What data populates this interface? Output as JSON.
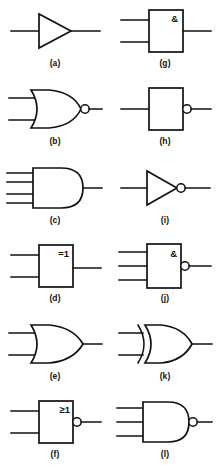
{
  "figure": {
    "background_color": "#ffffff",
    "line_color": "#111111",
    "columns": 2,
    "rows": 6
  },
  "gates": [
    {
      "caption": "(a)",
      "name": "buffer-amplifier",
      "notation": "distinctive-shape",
      "body": "triangle",
      "inputs": 1,
      "output_bubble": false,
      "symbol_label": ""
    },
    {
      "caption": "(b)",
      "name": "nor-gate",
      "notation": "distinctive-shape",
      "body": "or-shape",
      "inputs": 2,
      "output_bubble": true,
      "symbol_label": ""
    },
    {
      "caption": "(c)",
      "name": "and-gate-4-input",
      "notation": "distinctive-shape",
      "body": "and-shape",
      "inputs": 4,
      "output_bubble": false,
      "symbol_label": ""
    },
    {
      "caption": "(d)",
      "name": "xor-gate-iec",
      "notation": "rectangular",
      "body": "rectangle",
      "inputs": 2,
      "output_bubble": false,
      "symbol_label": "=1"
    },
    {
      "caption": "(e)",
      "name": "or-gate",
      "notation": "distinctive-shape",
      "body": "or-shape",
      "inputs": 2,
      "output_bubble": false,
      "symbol_label": ""
    },
    {
      "caption": "(f)",
      "name": "nor-gate-iec",
      "notation": "rectangular",
      "body": "rectangle",
      "inputs": 2,
      "output_bubble": true,
      "symbol_label": "≥1"
    },
    {
      "caption": "(g)",
      "name": "and-gate-iec",
      "notation": "rectangular",
      "body": "rectangle",
      "inputs": 2,
      "output_bubble": false,
      "symbol_label": "&"
    },
    {
      "caption": "(h)",
      "name": "inverter-iec",
      "notation": "rectangular",
      "body": "rectangle",
      "inputs": 1,
      "output_bubble": true,
      "symbol_label": ""
    },
    {
      "caption": "(i)",
      "name": "not-gate-inverter",
      "notation": "distinctive-shape",
      "body": "triangle",
      "inputs": 1,
      "output_bubble": true,
      "symbol_label": ""
    },
    {
      "caption": "(j)",
      "name": "nand-gate-iec-3-input",
      "notation": "rectangular",
      "body": "rectangle",
      "inputs": 3,
      "output_bubble": true,
      "symbol_label": "&"
    },
    {
      "caption": "(k)",
      "name": "xor-gate",
      "notation": "distinctive-shape",
      "body": "xor-shape",
      "inputs": 2,
      "output_bubble": false,
      "symbol_label": ""
    },
    {
      "caption": "(l)",
      "name": "nand-gate-3-input",
      "notation": "distinctive-shape",
      "body": "and-shape",
      "inputs": 3,
      "output_bubble": true,
      "symbol_label": ""
    }
  ]
}
